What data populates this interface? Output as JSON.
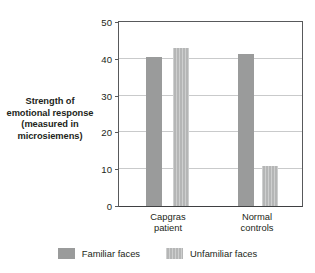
{
  "chart_data": {
    "type": "bar",
    "title": "",
    "xlabel": "",
    "ylabel": "Strength of emotional response (measured in microsiemens)",
    "ylabel_lines": [
      "Strength of",
      "emotional response",
      "(measured in",
      "microsiemens)"
    ],
    "categories": [
      "Capgras patient",
      "Normal controls"
    ],
    "category_lines": [
      [
        "Capgras",
        "patient"
      ],
      [
        "Normal",
        "controls"
      ]
    ],
    "series": [
      {
        "name": "Familiar faces",
        "values": [
          40.5,
          41.3
        ],
        "color": "#9a9b9b"
      },
      {
        "name": "Unfamiliar faces",
        "values": [
          43.0,
          11.0
        ],
        "color": "#b5b6b6"
      }
    ],
    "ylim": [
      0,
      50
    ],
    "yticks": [
      0,
      10,
      20,
      30,
      40,
      50
    ],
    "ytick_labels": [
      "0",
      "10",
      "20",
      "30",
      "40",
      "50"
    ],
    "grid": true,
    "legend_position": "bottom",
    "legend": [
      "Familiar faces",
      "Unfamiliar faces"
    ]
  },
  "colors": {
    "familiar": "#9a9b9b",
    "unfamiliar": "#b5b6b6",
    "axis": "#58595b",
    "grid": "#c9cacb",
    "text": "#231f20"
  }
}
